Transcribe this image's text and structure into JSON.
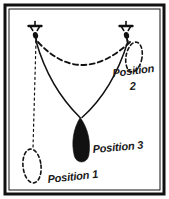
{
  "figure": {
    "background_color": "#ffffff",
    "ink_color": "#111111",
    "frame": {
      "name": "outer-border",
      "style": "double rectangular rule",
      "outer": {
        "x": 5,
        "y": 5,
        "width": 159,
        "height": 189
      },
      "inner": {
        "x": 9,
        "y": 9,
        "width": 151,
        "height": 181
      }
    },
    "labels": [
      {
        "id": "position-1",
        "text": "Position 1",
        "x": 48,
        "y": 183,
        "rotation": -6,
        "size": 11
      },
      {
        "id": "position-2",
        "text": "Position",
        "x": 113,
        "y": 77,
        "rotation": -7,
        "size": 11
      },
      {
        "id": "position-2-number",
        "text": "2",
        "x": 130,
        "y": 90,
        "rotation": -4,
        "size": 11
      },
      {
        "id": "position-3",
        "text": "Position 3",
        "x": 93,
        "y": 153,
        "rotation": -5,
        "size": 11
      }
    ],
    "anchors": [
      {
        "id": "pivot-left",
        "x": 35,
        "y": 32
      },
      {
        "id": "pivot-right",
        "x": 126,
        "y": 32
      }
    ],
    "bob": {
      "id": "pendulum-bob",
      "center_x": 81,
      "center_y": 140,
      "width": 20,
      "height": 45,
      "fill": "#111111"
    },
    "strings": [
      {
        "id": "string-from-left-pivot",
        "from": "pivot-left",
        "to": "bob-top",
        "style": "solid"
      },
      {
        "id": "string-from-right-pivot",
        "from": "pivot-right",
        "to": "bob-top",
        "style": "solid"
      }
    ],
    "dashed_paths": [
      {
        "id": "swing-arc",
        "description": "dashed arc showing the swing path between pivots",
        "style": "dashed"
      },
      {
        "id": "ghost-bob-position-1",
        "description": "dashed outline of bob at Position 1",
        "cx": 32,
        "cy": 166,
        "rx": 9,
        "ry": 17,
        "style": "dashed"
      },
      {
        "id": "ghost-bob-position-2",
        "description": "dashed outline of bob at Position 2",
        "cx": 134,
        "cy": 57,
        "rx": 8,
        "ry": 15,
        "style": "dashed"
      },
      {
        "id": "drop-line-position-1",
        "description": "dotted vertical line from left pivot down to Position 1",
        "style": "dotted"
      }
    ]
  }
}
